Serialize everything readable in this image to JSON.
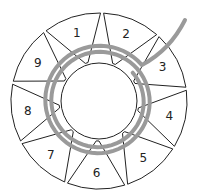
{
  "diagram": {
    "title": "",
    "segments": [
      {
        "label": "1",
        "angle": -108
      },
      {
        "label": "2",
        "angle": -68
      },
      {
        "label": "3",
        "angle": -28
      },
      {
        "label": "4",
        "angle": 12
      },
      {
        "label": "5",
        "angle": 52
      },
      {
        "label": "6",
        "angle": 92
      },
      {
        "label": "7",
        "angle": 132
      },
      {
        "label": "8",
        "angle": 172
      },
      {
        "label": "9",
        "angle": 212
      }
    ],
    "colors": {
      "outline": "#222222",
      "spiral": "#9a9a9a",
      "background": "#ffffff"
    }
  }
}
